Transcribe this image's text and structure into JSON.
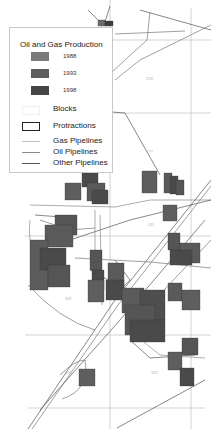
{
  "legend": {
    "title": "Oil and Gas Production",
    "years": [
      {
        "label": "1988",
        "color": "#7a7a7a"
      },
      {
        "label": "1993",
        "color": "#5e5e5e"
      },
      {
        "label": "1998",
        "color": "#454545"
      }
    ],
    "blocks_label": "Blocks",
    "protractions_label": "Protractions",
    "gas_label": "Gas Pipelines",
    "oil_label": "Oil Pipelines",
    "other_label": "Other Pipelines",
    "gas_color": "#b8b8b8",
    "oil_color": "#8a8a8a",
    "other_color": "#555555"
  },
  "map": {
    "protraction_labels": [
      {
        "text": "233",
        "x": 149,
        "y": 79
      },
      {
        "text": "???",
        "x": 148,
        "y": 152
      },
      {
        "text": "111",
        "x": 150,
        "y": 225
      },
      {
        "text": "331",
        "x": 67,
        "y": 299
      },
      {
        "text": "332",
        "x": 154,
        "y": 373
      },
      {
        "text": "301",
        "x": 67,
        "y": 373
      }
    ]
  }
}
